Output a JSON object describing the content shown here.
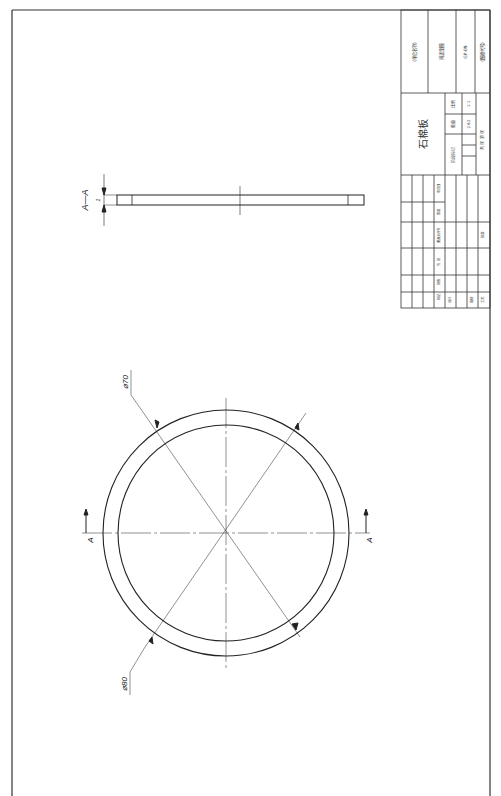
{
  "drawing": {
    "part_name": "石棉板",
    "section_label": "A—A",
    "section_marker": "A",
    "dimensions": {
      "thickness": "1",
      "inner_diameter": "⌀70",
      "outer_diameter": "⌀80"
    }
  },
  "title_block": {
    "company": "(单位名称)",
    "drawing_name": "阀盖垫圈",
    "drawing_number": "GP-09",
    "code": "(图样代号)",
    "scale_label": "比例",
    "scale_value": "1:1",
    "weight_label": "重量",
    "weight_value": "2.62",
    "stage_label": "阶段标记",
    "sheet_info": "共 张 第 张",
    "headers": [
      "标记",
      "处数",
      "分 区",
      "更改文件号",
      "签名",
      "年月日"
    ],
    "roles": [
      "设计",
      "审核",
      "工艺"
    ],
    "approve": "批准"
  }
}
